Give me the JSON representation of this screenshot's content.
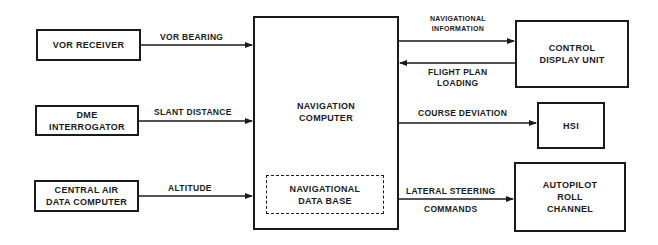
{
  "diagram": {
    "blocks": {
      "vor_receiver": "VOR RECEIVER",
      "dme_interrogator": "DME\nINTERROGATOR",
      "central_air_data_computer": "CENTRAL AIR\nDATA COMPUTER",
      "navigation_computer": "NAVIGATION\nCOMPUTER",
      "navigational_data_base": "NAVIGATIONAL\nDATA BASE",
      "control_display_unit": "CONTROL\nDISPLAY UNIT",
      "hsi": "HSI",
      "autopilot_roll_channel": "AUTOPILOT\nROLL\nCHANNEL"
    },
    "signals": {
      "vor_bearing": "VOR BEARING",
      "slant_distance": "SLANT DISTANCE",
      "altitude": "ALTITUDE",
      "navigational_information": "NAVIGATIONAL\nINFORMATION",
      "flight_plan_loading": "FLIGHT PLAN\nLOADING",
      "course_deviation": "COURSE DEVIATION",
      "lateral_steering": "LATERAL STEERING",
      "commands": "COMMANDS"
    },
    "colors": {
      "line": "#1a1a1a",
      "background": "#ffffff"
    }
  }
}
